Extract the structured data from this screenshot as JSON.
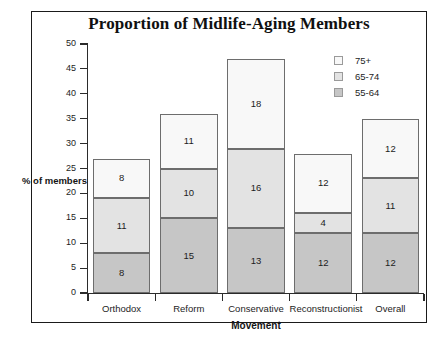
{
  "chart_data": {
    "type": "bar",
    "subtype": "stacked-bar",
    "title": "Proportion of Midlife-Aging Members",
    "xlabel": "Movement",
    "ylabel": "% of members",
    "categories": [
      "Orthodox",
      "Reform",
      "Conservative",
      "Reconstructionist",
      "Overall"
    ],
    "series": [
      {
        "name": "55-64",
        "values": [
          8,
          15,
          13,
          12,
          12
        ],
        "color": "#c6c6c6"
      },
      {
        "name": "65-74",
        "values": [
          11,
          10,
          16,
          4,
          11
        ],
        "color": "#e3e3e3"
      },
      {
        "name": "75+",
        "values": [
          8,
          11,
          18,
          12,
          12
        ],
        "color": "#f8f8f8"
      }
    ],
    "totals": [
      27,
      36,
      47,
      28,
      35
    ],
    "ylim": [
      0,
      50
    ],
    "yticks": [
      0,
      5,
      10,
      15,
      20,
      25,
      30,
      35,
      40,
      45,
      50
    ],
    "ytick_labels": [
      "0",
      "5",
      "10",
      "15",
      "20",
      "25",
      "30",
      "35",
      "40",
      "45",
      "50"
    ],
    "grid": false,
    "legend_position": "top-right",
    "legend_order": [
      "75+",
      "65-74",
      "55-64"
    ]
  },
  "legend": {
    "entries": [
      {
        "label": "75+",
        "color": "#f8f8f8"
      },
      {
        "label": "65-74",
        "color": "#e3e3e3"
      },
      {
        "label": "55-64",
        "color": "#c6c6c6"
      }
    ]
  },
  "colors": {
    "frame": "#1a1a1a",
    "axis": "#2b2b2b",
    "text": "#1d1d1d",
    "background": "#ffffff"
  }
}
